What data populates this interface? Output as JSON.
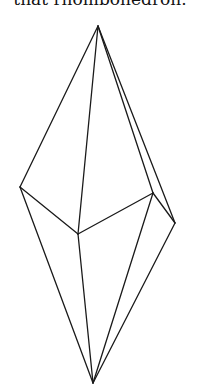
{
  "caption": "that rhombohedron.",
  "figure": {
    "name": "rhombohedron",
    "vertices": {
      "top": [
        98,
        26
      ],
      "left": [
        20,
        187
      ],
      "center": [
        78,
        234
      ],
      "right_inner": [
        153,
        193
      ],
      "far_right": [
        175,
        223
      ],
      "bottom": [
        93,
        383
      ]
    },
    "stroke_color": "#1a1a1a"
  }
}
